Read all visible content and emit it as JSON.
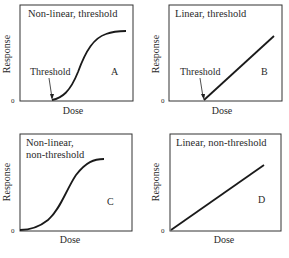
{
  "panels": [
    {
      "id": "A",
      "title_lines": [
        "Non-linear, threshold"
      ],
      "letter": "A",
      "x_label": "Dose",
      "y_label": "Response",
      "origin_label": "0",
      "threshold_label": "Threshold",
      "curve_type": "sigmoid with threshold"
    },
    {
      "id": "B",
      "title_lines": [
        "Linear, threshold"
      ],
      "letter": "B",
      "x_label": "Dose",
      "y_label": "Response",
      "origin_label": "0",
      "threshold_label": "Threshold",
      "curve_type": "linear with threshold"
    },
    {
      "id": "C",
      "title_lines": [
        "Non-linear,",
        "non-threshold"
      ],
      "letter": "C",
      "x_label": "Dose",
      "y_label": "Response",
      "origin_label": "0",
      "curve_type": "sigmoid without threshold"
    },
    {
      "id": "D",
      "title_lines": [
        "Linear, non-threshold"
      ],
      "letter": "D",
      "x_label": "Dose",
      "y_label": "Response",
      "origin_label": "0",
      "curve_type": "linear without threshold"
    }
  ],
  "colors": {
    "line": "#1a1a1a",
    "frame": "#333333",
    "text": "#2a2a2a"
  }
}
